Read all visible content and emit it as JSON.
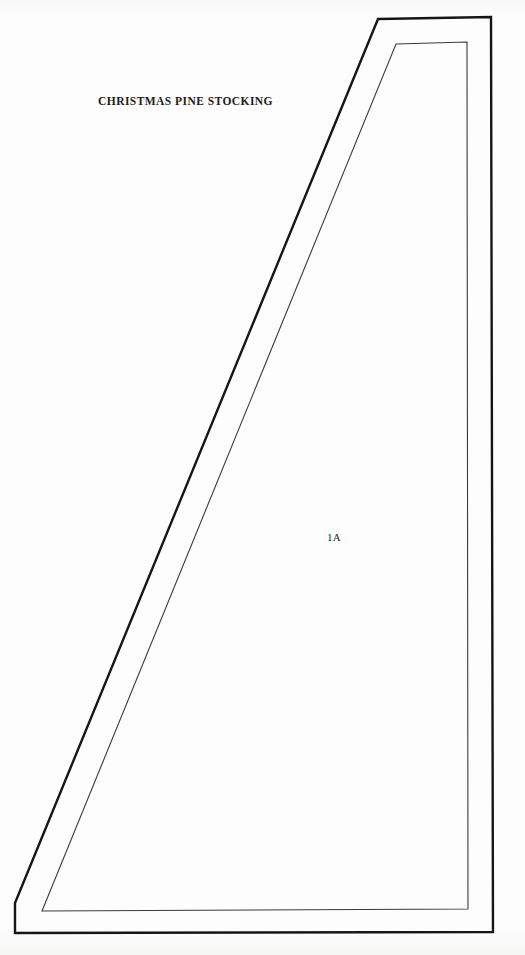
{
  "document": {
    "title": "CHRISTMAS PINE STOCKING",
    "piece_label": "1A",
    "background_color": "#fdfdfc",
    "line_color": "#161616",
    "inner_line_color": "#3a3a3a"
  },
  "pattern": {
    "cut_line_name": "outer-cut-line",
    "seam_line_name": "inner-seam-line",
    "outer_outline_points": "378,19 491,17 493,932 15,933 15,903",
    "inner_outline_points": "396,44 467,42 468,909 42,911",
    "outer_stroke_width": "2.4",
    "inner_stroke_width": "1.1"
  }
}
